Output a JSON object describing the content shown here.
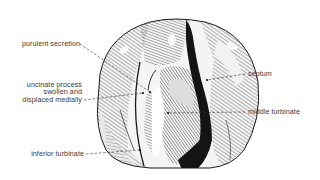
{
  "figure": {
    "type": "anatomical-illustration",
    "labels_left": [
      {
        "id": "purulent-secretion",
        "lines": [
          "purulent secretion"
        ]
      },
      {
        "id": "uncinate-process",
        "lines": [
          "uncinate process",
          "swollen and",
          "displaced medially"
        ]
      },
      {
        "id": "inferior-turbinate",
        "lines": [
          "inferior turbinate"
        ]
      }
    ],
    "labels_right": [
      {
        "id": "septum",
        "lines": [
          "septum"
        ]
      },
      {
        "id": "middle-turbinate",
        "lines": [
          "middle turbinate"
        ]
      }
    ],
    "colors": {
      "background": "#ffffff",
      "ink": "#1a1a1a",
      "label_text": "#3a3a3a",
      "shade": "#9a9a9a"
    }
  }
}
